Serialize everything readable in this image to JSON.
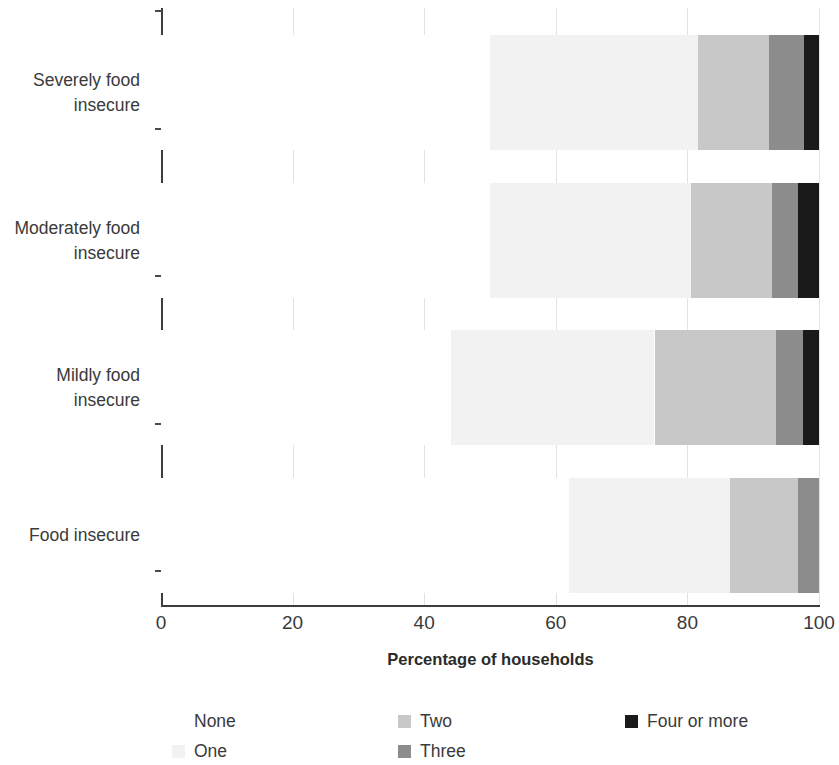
{
  "chart_data": {
    "type": "bar",
    "orientation": "horizontal",
    "stacked": true,
    "stack_mode": "percent",
    "title": "Number of coping strategies used by households, by food insecurity category",
    "xlabel": "Percentage of households",
    "ylabel": "",
    "xlim": [
      0,
      100
    ],
    "xticks": [
      0,
      20,
      40,
      60,
      80,
      100
    ],
    "xtick_labels": [
      "0",
      "20",
      "40",
      "60",
      "80",
      "100"
    ],
    "grid": "vertical",
    "legend_position": "bottom",
    "categories": [
      "Severely food insecure",
      "Moderately food insecure",
      "Mildly food insecure",
      "Food insecure"
    ],
    "series": [
      {
        "name": "None",
        "color": "#ffffff",
        "values": [
          50.0,
          50.0,
          44.0,
          62.0
        ]
      },
      {
        "name": "One",
        "color": "#f2f2f2",
        "values": [
          31.6,
          30.6,
          31.0,
          24.5
        ]
      },
      {
        "name": "Two",
        "color": "#c8c8c8",
        "values": [
          10.8,
          12.3,
          18.5,
          10.3
        ]
      },
      {
        "name": "Three",
        "color": "#8c8c8c",
        "values": [
          5.3,
          3.9,
          4.0,
          3.2
        ]
      },
      {
        "name": "Four or more",
        "color": "#1a1a1a",
        "values": [
          2.3,
          3.2,
          2.5,
          0.0
        ]
      }
    ]
  },
  "legend": {
    "entries": [
      {
        "label": "None",
        "color": "#ffffff"
      },
      {
        "label": "One",
        "color": "#f2f2f2"
      },
      {
        "label": "Two",
        "color": "#c8c8c8"
      },
      {
        "label": "Three",
        "color": "#8c8c8c"
      },
      {
        "label": "Four or more",
        "color": "#1a1a1a"
      }
    ]
  },
  "colors": {
    "axis": "#3d3d3d",
    "grid": "#e3e3e3",
    "text": "#3a3a3a",
    "title": "#2b2b2b"
  }
}
